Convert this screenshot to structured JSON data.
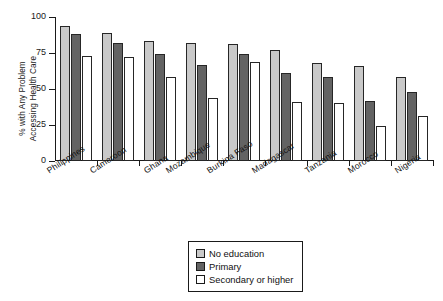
{
  "chart_data": {
    "type": "bar",
    "title": "",
    "xlabel": "",
    "ylabel": "% with Any Problem Accessing Health Care",
    "ylabel_line1": "% with Any Problem",
    "ylabel_line2": "Accessing Health Care",
    "ylim": [
      0,
      100
    ],
    "yticks": [
      0,
      25,
      50,
      75,
      100
    ],
    "ytick_labels": [
      "0",
      "25",
      "50",
      "75",
      "100"
    ],
    "grid": false,
    "legend_position": "bottom-center",
    "categories": [
      "Philippines",
      "Cameroon",
      "Ghana",
      "Mozambique",
      "Burkina Faso",
      "Madagascar",
      "Tanzania",
      "Morocco",
      "Nigeria"
    ],
    "series": [
      {
        "name": "No education",
        "color": "#c9c9c9",
        "values": [
          94,
          89,
          83,
          82,
          81,
          77,
          68,
          66,
          58
        ]
      },
      {
        "name": "Primary",
        "color": "#636363",
        "values": [
          88,
          82,
          74,
          67,
          74,
          61,
          58,
          42,
          48
        ]
      },
      {
        "name": "Secondary or higher",
        "color": "#ffffff",
        "values": [
          73,
          72,
          58,
          44,
          69,
          41,
          40,
          24,
          31
        ]
      }
    ]
  }
}
